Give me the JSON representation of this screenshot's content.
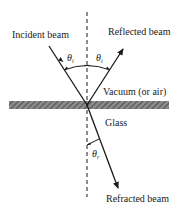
{
  "diagram": {
    "title": "",
    "labels": {
      "incident": "Incident beam",
      "reflected": "Reflected beam",
      "medium_top": "Vacuum (or air)",
      "medium_bottom": "Glass",
      "refracted": "Refracted beam"
    },
    "angles": {
      "incident": {
        "symbol": "θ",
        "subscript": "i"
      },
      "reflected": {
        "symbol": "θ",
        "subscript": "i"
      },
      "refracted": {
        "symbol": "θ",
        "subscript": "r"
      }
    },
    "colors": {
      "line": "#1a1a1a",
      "surface_fill": "#777777",
      "background": "#ffffff"
    }
  }
}
